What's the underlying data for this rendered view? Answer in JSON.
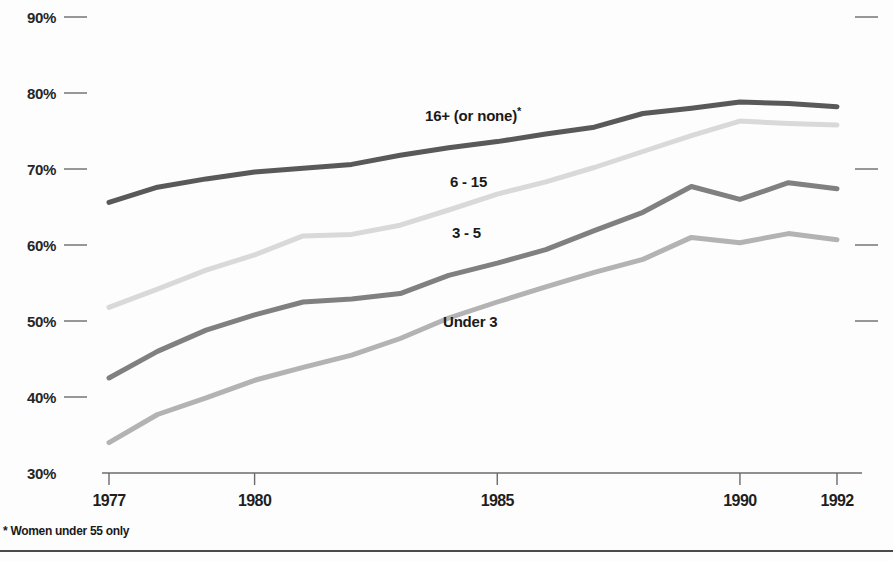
{
  "chart_data": {
    "type": "line",
    "title": "",
    "subtitle": "",
    "xlabel": "",
    "ylabel": "",
    "grid": false,
    "legend_position": "inline-labels",
    "x": [
      1977,
      1978,
      1979,
      1980,
      1981,
      1982,
      1983,
      1984,
      1985,
      1986,
      1987,
      1988,
      1989,
      1990,
      1991,
      1992
    ],
    "xlim": [
      1977,
      1992
    ],
    "ylim": [
      30,
      90
    ],
    "x_tick_labels": [
      "1977",
      "1980",
      "1985",
      "1990",
      "1992"
    ],
    "x_tick_values": [
      1977,
      1980,
      1985,
      1990,
      1992
    ],
    "y_tick_labels": [
      "30%",
      "40%",
      "50%",
      "60%",
      "70%",
      "80%",
      "90%"
    ],
    "y_tick_values": [
      30,
      40,
      50,
      60,
      70,
      80,
      90
    ],
    "series": [
      {
        "name": "16+ (or none)*",
        "label": "16+ (or none)",
        "label_superscript": "*",
        "color": "#595959",
        "values": [
          65.6,
          67.6,
          68.7,
          69.6,
          70.1,
          70.6,
          71.8,
          72.8,
          73.6,
          74.6,
          75.5,
          77.3,
          78.0,
          78.8,
          78.6,
          78.2
        ]
      },
      {
        "name": "6 - 15",
        "label": "6 - 15",
        "label_superscript": "",
        "color": "#d9d9d9",
        "values": [
          51.8,
          54.2,
          56.7,
          58.7,
          61.2,
          61.4,
          62.6,
          64.6,
          66.7,
          68.3,
          70.2,
          72.3,
          74.4,
          76.3,
          76.0,
          75.8
        ]
      },
      {
        "name": "3 - 5",
        "label": "3 - 5",
        "label_superscript": "",
        "color": "#808080",
        "values": [
          42.5,
          46.0,
          48.8,
          50.8,
          52.5,
          52.9,
          53.6,
          56.0,
          57.6,
          59.4,
          61.9,
          64.3,
          67.7,
          66.0,
          68.2,
          67.4
        ]
      },
      {
        "name": "Under 3",
        "label": "Under 3",
        "label_superscript": "",
        "color": "#b3b3b3",
        "values": [
          34.0,
          37.7,
          39.9,
          42.2,
          43.9,
          45.5,
          47.7,
          50.4,
          52.5,
          54.5,
          56.4,
          58.1,
          61.0,
          60.3,
          61.5,
          60.7
        ]
      }
    ],
    "series_label_positions": [
      {
        "name": "16+ (or none)*",
        "x": 425,
        "y": 105
      },
      {
        "name": "6 - 15",
        "x": 450,
        "y": 173
      },
      {
        "name": "3 - 5",
        "x": 452,
        "y": 224
      },
      {
        "name": "Under 3",
        "x": 443,
        "y": 313
      }
    ],
    "annotations": [
      "* Women under 55 only"
    ]
  },
  "footnote": "* Women under 55 only",
  "colors": {
    "axis": "#6b6b6b",
    "text": "#1a1a1a",
    "background": "#fdfdfd",
    "rule": "#4a4a4a"
  },
  "geometry": {
    "plot_left": 109,
    "plot_right": 837,
    "baseline_y": 473,
    "px_per_percent": 7.6
  }
}
